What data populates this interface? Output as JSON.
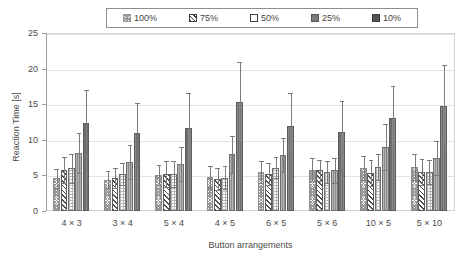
{
  "chart_data": {
    "type": "bar",
    "title": "",
    "xlabel": "Button arrangements",
    "ylabel": "Reaction Time [s]",
    "ylim": [
      0,
      25
    ],
    "yticks": [
      0,
      5,
      10,
      15,
      20,
      25
    ],
    "grid": true,
    "legend_position": "top",
    "error_bars": true,
    "categories": [
      "4 × 3",
      "3 × 4",
      "5 × 4",
      "4 × 5",
      "6 × 5",
      "5 × 6",
      "10 × 5",
      "5 × 10"
    ],
    "series": [
      {
        "name": "100%",
        "pattern": "stipple-checker",
        "values": [
          4.6,
          4.4,
          5.1,
          4.8,
          5.5,
          5.8,
          6.0,
          6.2
        ],
        "err_high": [
          5.9,
          5.6,
          6.5,
          6.3,
          7.0,
          7.4,
          7.7,
          8.0
        ],
        "err_low": [
          3.3,
          3.2,
          3.7,
          3.3,
          4.0,
          4.2,
          4.3,
          4.4
        ]
      },
      {
        "name": "75%",
        "pattern": "diagonal-hatch",
        "values": [
          5.8,
          4.6,
          5.2,
          4.5,
          5.2,
          5.7,
          5.3,
          5.5
        ],
        "err_high": [
          7.6,
          6.0,
          7.0,
          6.0,
          6.8,
          7.2,
          7.1,
          7.3
        ],
        "err_low": [
          4.0,
          3.2,
          3.4,
          3.0,
          3.6,
          4.2,
          3.5,
          3.7
        ]
      },
      {
        "name": "50%",
        "pattern": "sparse-dots",
        "values": [
          6.0,
          5.2,
          5.2,
          4.7,
          6.1,
          5.5,
          6.2,
          5.5
        ],
        "err_high": [
          8.0,
          6.8,
          7.0,
          6.3,
          7.6,
          7.0,
          8.0,
          7.2
        ],
        "err_low": [
          4.0,
          3.6,
          3.4,
          3.1,
          4.6,
          4.0,
          4.4,
          3.8
        ]
      },
      {
        "name": "25%",
        "pattern": "medium-gray",
        "values": [
          8.2,
          6.9,
          6.6,
          8.0,
          7.9,
          5.7,
          9.0,
          7.5
        ],
        "err_high": [
          11.0,
          9.3,
          9.0,
          10.6,
          10.3,
          7.5,
          12.2,
          9.9
        ],
        "err_low": [
          5.4,
          4.5,
          4.2,
          5.4,
          5.5,
          3.9,
          5.8,
          5.1
        ]
      },
      {
        "name": "10%",
        "pattern": "dark-gray",
        "values": [
          12.4,
          11.0,
          11.7,
          15.3,
          12.0,
          11.1,
          13.1,
          14.8
        ],
        "err_high": [
          17.0,
          15.2,
          16.6,
          20.9,
          16.6,
          15.4,
          17.6,
          20.5
        ],
        "err_low": [
          7.8,
          6.8,
          6.8,
          9.7,
          7.4,
          6.8,
          8.6,
          9.1
        ]
      }
    ]
  },
  "legend": {
    "items": [
      {
        "label": "100%",
        "swatch": "pattern-swatch-100"
      },
      {
        "label": "75%",
        "swatch": "pattern-swatch-75"
      },
      {
        "label": "50%",
        "swatch": "pattern-swatch-50"
      },
      {
        "label": "25%",
        "swatch": "pattern-swatch-25"
      },
      {
        "label": "10%",
        "swatch": "pattern-swatch-10"
      }
    ]
  },
  "axes": {
    "y_title": "Reaction Time [s]",
    "x_title": "Button arrangements",
    "y_tick_labels": [
      "0",
      "5",
      "10",
      "15",
      "20",
      "25"
    ],
    "x_tick_labels": [
      "4 × 3",
      "3 × 4",
      "5 × 4",
      "4 × 5",
      "6 × 5",
      "5 × 6",
      "10 × 5",
      "5 × 10"
    ]
  },
  "colors": {
    "grid": "#e2e2e2",
    "axis": "#9c9c9c",
    "text": "#4a4a4a",
    "bar_25": "#8d8d8d",
    "bar_10": "#6e6e6e",
    "error_bar": "#7b7b7b",
    "legend_border": "#8e8e8e"
  }
}
